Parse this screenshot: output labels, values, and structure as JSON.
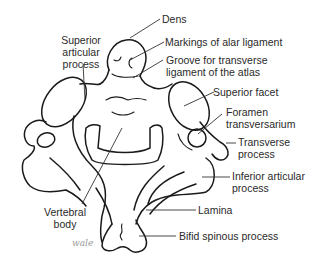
{
  "diagram": {
    "labels": {
      "dens": "Dens",
      "alar": "Markings of alar ligament",
      "groove_1": "Groove for transverse",
      "groove_2": "ligament of the atlas",
      "sup_art_1": "Superior",
      "sup_art_2": "articular",
      "sup_art_3": "process",
      "sup_facet": "Superior facet",
      "foramen_1": "Foramen",
      "foramen_2": "transversarium",
      "trans_1": "Transverse",
      "trans_2": "process",
      "inf_art_1": "Inferior articular",
      "inf_art_2": "process",
      "vert_1": "Vertebral",
      "vert_2": "body",
      "lamina": "Lamina",
      "bifid": "Bifid spinous process"
    },
    "signature": "wale"
  }
}
